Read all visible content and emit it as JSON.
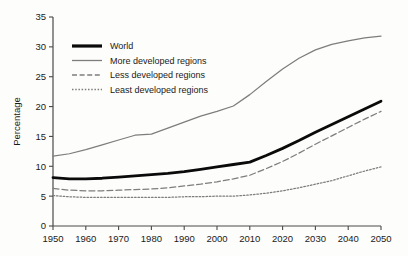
{
  "chart_data": {
    "type": "line",
    "title": "",
    "xlabel": "",
    "ylabel": "Percentage",
    "xlim": [
      1950,
      2050
    ],
    "ylim": [
      0,
      35
    ],
    "grid": false,
    "legend_position": "top-left-inside",
    "x": [
      1950,
      1955,
      1960,
      1965,
      1970,
      1975,
      1980,
      1985,
      1990,
      1995,
      2000,
      2005,
      2010,
      2015,
      2020,
      2025,
      2030,
      2035,
      2040,
      2045,
      2050
    ],
    "xticks": [
      "1950",
      "1960",
      "1970",
      "1980",
      "1990",
      "2000",
      "2010",
      "2020",
      "2030",
      "2040",
      "2050"
    ],
    "xtick_values": [
      1950,
      1960,
      1970,
      1980,
      1990,
      2000,
      2010,
      2020,
      2030,
      2040,
      2050
    ],
    "yticks": [
      "0",
      "5",
      "10",
      "15",
      "20",
      "25",
      "30",
      "35"
    ],
    "ytick_values": [
      0,
      5,
      10,
      15,
      20,
      25,
      30,
      35
    ],
    "series": [
      {
        "name": "World",
        "style": "solid-thick",
        "color": "#0a0a0a",
        "values": [
          8.1,
          7.9,
          7.9,
          8.0,
          8.2,
          8.4,
          8.6,
          8.8,
          9.1,
          9.5,
          9.9,
          10.3,
          10.7,
          11.8,
          13.0,
          14.3,
          15.7,
          17.0,
          18.3,
          19.6,
          20.9
        ]
      },
      {
        "name": "More developed regions",
        "style": "solid-thin",
        "color": "#7d7d7d",
        "values": [
          11.7,
          12.1,
          12.8,
          13.6,
          14.4,
          15.2,
          15.4,
          16.4,
          17.4,
          18.4,
          19.2,
          20.1,
          22.0,
          24.2,
          26.3,
          28.1,
          29.5,
          30.4,
          31.0,
          31.5,
          31.8
        ]
      },
      {
        "name": "Less developed regions",
        "style": "dashed",
        "color": "#7d7d7d",
        "values": [
          6.3,
          6.0,
          5.9,
          5.9,
          6.0,
          6.1,
          6.2,
          6.4,
          6.7,
          7.0,
          7.4,
          7.9,
          8.5,
          9.6,
          10.8,
          12.2,
          13.7,
          15.1,
          16.5,
          17.9,
          19.2
        ]
      },
      {
        "name": "Least developed regions",
        "style": "dotted",
        "color": "#7d7d7d",
        "values": [
          5.1,
          4.9,
          4.8,
          4.8,
          4.8,
          4.8,
          4.8,
          4.8,
          4.9,
          4.9,
          5.0,
          5.0,
          5.2,
          5.5,
          5.9,
          6.4,
          7.0,
          7.6,
          8.4,
          9.2,
          9.9
        ]
      }
    ],
    "legend": [
      {
        "label": "World"
      },
      {
        "label": "More developed regions"
      },
      {
        "label": "Less developed regions"
      },
      {
        "label": "Least developed regions"
      }
    ]
  }
}
